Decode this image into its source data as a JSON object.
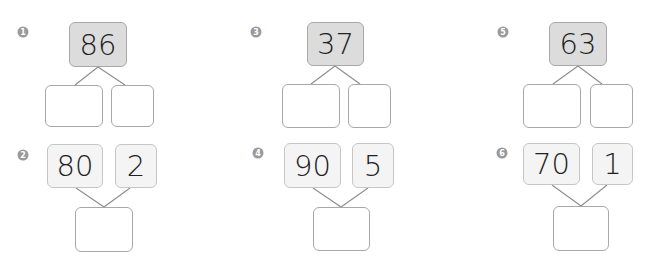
{
  "problems": [
    {
      "number": "1",
      "type": "decompose",
      "whole": "86",
      "parts": [
        "",
        ""
      ]
    },
    {
      "number": "2",
      "type": "compose",
      "parts": [
        "80",
        "2"
      ],
      "whole": ""
    },
    {
      "number": "3",
      "type": "decompose",
      "whole": "37",
      "parts": [
        "",
        ""
      ]
    },
    {
      "number": "4",
      "type": "compose",
      "parts": [
        "90",
        "5"
      ],
      "whole": ""
    },
    {
      "number": "5",
      "type": "decompose",
      "whole": "63",
      "parts": [
        "",
        ""
      ]
    },
    {
      "number": "6",
      "type": "compose",
      "parts": [
        "70",
        "1"
      ],
      "whole": ""
    }
  ],
  "colors": {
    "whole_fill": "#dcdcdc",
    "part_fill": "#f4f4f4",
    "border": "#a8a8a8",
    "badge": "#9a9a9a",
    "line": "#8c8c8c"
  }
}
